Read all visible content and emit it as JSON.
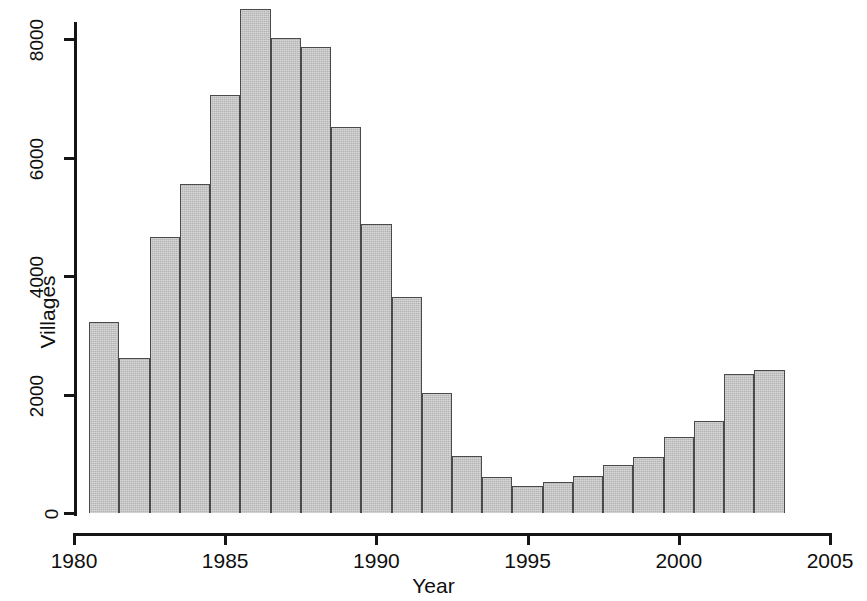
{
  "chart_data": {
    "type": "bar",
    "title": "",
    "xlabel": "Year",
    "ylabel": "Villages",
    "xlim": [
      1980,
      2005
    ],
    "ylim": [
      0,
      8800
    ],
    "grid": false,
    "legend": null,
    "bar_edges": [
      1980.5,
      2003.5
    ],
    "bin_width": 1,
    "xticks": [
      1980,
      1985,
      1990,
      1995,
      2000,
      2005
    ],
    "xticklabels": [
      "1980",
      "1985",
      "1990",
      "1995",
      "2000",
      "2005"
    ],
    "yticks": [
      0,
      2000,
      4000,
      6000,
      8000
    ],
    "yticklabels": [
      "0",
      "2000",
      "4000",
      "6000",
      "8000"
    ],
    "categories": [
      1981,
      1982,
      1983,
      1984,
      1985,
      1986,
      1987,
      1988,
      1989,
      1990,
      1991,
      1992,
      1993,
      1994,
      1995,
      1996,
      1997,
      1998,
      1999,
      2000,
      2001,
      2002,
      2003
    ],
    "values": [
      3230,
      2620,
      4650,
      5550,
      7050,
      8500,
      8020,
      7860,
      6520,
      4870,
      3640,
      2030,
      970,
      610,
      460,
      530,
      620,
      810,
      950,
      1290,
      1550,
      2350,
      2410
    ],
    "bar_color": "#b4b4b4",
    "bar_edge_color": "#4a4a4a",
    "axis_color": "#151515"
  },
  "axes": {
    "x_title": "Year",
    "y_title": "Villages"
  }
}
